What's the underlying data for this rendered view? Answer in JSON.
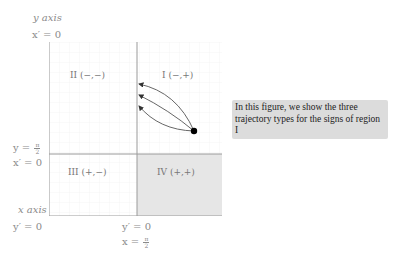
{
  "axes": {
    "y_axis_label": "y axis",
    "x_axis_label": "x axis",
    "top_left_eq": "x′ = 0",
    "mid_left_eq_lhs": "y =",
    "mid_left_eq_frac_num": "π",
    "mid_left_eq_frac_den": "2",
    "mid_left_eq2": "x′ = 0",
    "bottom_left_eq": "y′ = 0",
    "bottom_center_eq": "y′ = 0",
    "bottom_center_eq2_lhs": "x =",
    "bottom_center_eq2_frac_num": "π",
    "bottom_center_eq2_frac_den": "2"
  },
  "regions": {
    "I": "I (−,+)",
    "II": "II (−,−)",
    "III": "III (+,−)",
    "IV": "IV (+,+)"
  },
  "colors": {
    "shaded_region": "#e6e6e6",
    "grid": "#f0f0f0",
    "axis_line": "#9a9a9a",
    "trajectory": "#555555",
    "point": "#000000",
    "note_bg": "#dcdcdc"
  },
  "trajectories": {
    "start_point": {
      "x": 194,
      "y": 131
    },
    "end_points": [
      {
        "x": 139,
        "y": 84
      },
      {
        "x": 139,
        "y": 95
      },
      {
        "x": 139,
        "y": 106
      }
    ],
    "count": 3
  },
  "note": {
    "text": "In this figure, we show the three trajectory types for the signs of region I"
  }
}
